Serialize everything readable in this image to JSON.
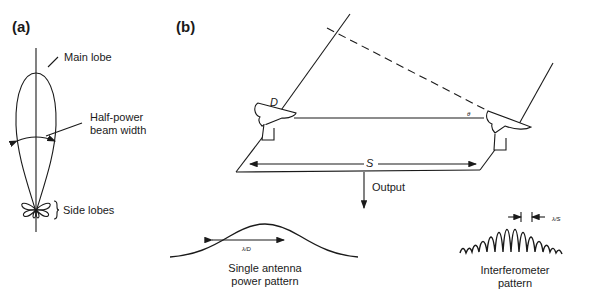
{
  "panels": {
    "a": {
      "label": "(a)",
      "annotations": {
        "main_lobe": "Main lobe",
        "half_power_line1": "Half-power",
        "half_power_line2": "beam width",
        "side_lobes": "Side lobes"
      }
    },
    "b": {
      "label": "(b)",
      "symbols": {
        "dish_diameter": "D",
        "angle": "θ",
        "baseline": "S",
        "single_beamwidth": "λ/D",
        "fringe_spacing": "λ/S"
      },
      "output_label": "Output",
      "single_pattern_line1": "Single antenna",
      "single_pattern_line2": "power pattern",
      "interferometer_line1": "Interferometer",
      "interferometer_line2": "pattern"
    }
  },
  "colors": {
    "line": "#1a1a1a",
    "background": "#ffffff"
  }
}
